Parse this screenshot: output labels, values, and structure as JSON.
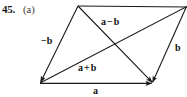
{
  "figure": {
    "problem_number": "45.",
    "part": "(a)",
    "stroke_color": "#1a1a1a",
    "background_color": "#ffffff",
    "labels": {
      "side_bottom": "a",
      "side_right": "b",
      "side_left": "−b",
      "diagonal_upper": "a − b",
      "diagonal_lower": "a + b"
    },
    "label_parts": {
      "a_minus_b": {
        "first": "a",
        "operator": "−",
        "second": "b"
      },
      "a_plus_b": {
        "first": "a",
        "operator": "+",
        "second": "b"
      }
    },
    "geometry": {
      "vertex_bottom_left": "40,83",
      "vertex_top_left": "78,6",
      "vertex_top_right": "186,7",
      "vertex_bottom_right": "152,83",
      "diagonal_crossing": "117,48"
    }
  }
}
